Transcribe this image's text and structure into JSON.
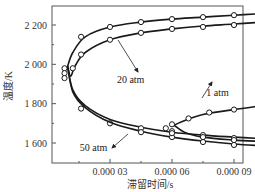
{
  "chart_data": {
    "type": "line",
    "title": "",
    "xlabel": "滞留时间/s",
    "ylabel": "温度/K",
    "xlim": [
      0.0,
      0.000105
    ],
    "ylim": [
      1500,
      2300
    ],
    "x_ticks": [
      {
        "value": 3e-05,
        "label": "0.000 03"
      },
      {
        "value": 6e-05,
        "label": "0.000 06"
      },
      {
        "value": 9e-05,
        "label": "0.000 09"
      }
    ],
    "y_ticks": [
      {
        "value": 1600,
        "label": "1 600"
      },
      {
        "value": 1800,
        "label": "1 800"
      },
      {
        "value": 2000,
        "label": "2 000"
      },
      {
        "value": 2200,
        "label": "2 200"
      }
    ],
    "grid": false,
    "series": [
      {
        "name": "20 atm upper branch",
        "points": [
          [
            9.5e-06,
            1990
          ],
          [
            1.2e-05,
            2060
          ],
          [
            1.8e-05,
            2140
          ],
          [
            3e-05,
            2190
          ],
          [
            4.5e-05,
            2215
          ],
          [
            6e-05,
            2230
          ],
          [
            7.5e-05,
            2240
          ],
          [
            9e-05,
            2250
          ],
          [
            0.000104,
            2258
          ]
        ],
        "markers": [
          [
            1.6e-05,
            2140
          ],
          [
            3e-05,
            2190
          ],
          [
            4.5e-05,
            2215
          ],
          [
            6e-05,
            2230
          ],
          [
            7.5e-05,
            2240
          ],
          [
            9e-05,
            2250
          ]
        ]
      },
      {
        "name": "50 atm upper branch",
        "points": [
          [
            9.5e-06,
            1990
          ],
          [
            1.1e-05,
            1940
          ],
          [
            1.3e-05,
            1990
          ],
          [
            1.8e-05,
            2060
          ],
          [
            3e-05,
            2125
          ],
          [
            4.5e-05,
            2160
          ],
          [
            6e-05,
            2180
          ],
          [
            7.5e-05,
            2195
          ],
          [
            9e-05,
            2205
          ],
          [
            0.000104,
            2215
          ]
        ],
        "markers": [
          [
            8e-06,
            1980
          ],
          [
            8e-06,
            1955
          ],
          [
            1.2e-05,
            1980
          ],
          [
            1.6e-05,
            2050
          ],
          [
            3e-05,
            2125
          ],
          [
            4.5e-05,
            2160
          ],
          [
            6e-05,
            2180
          ],
          [
            7.5e-05,
            2190
          ],
          [
            9e-05,
            2200
          ]
        ]
      },
      {
        "name": "20 atm lower branch",
        "points": [
          [
            9.5e-06,
            1990
          ],
          [
            1.2e-05,
            1870
          ],
          [
            1.8e-05,
            1790
          ],
          [
            3e-05,
            1720
          ],
          [
            4.5e-05,
            1680
          ],
          [
            6e-05,
            1655
          ],
          [
            7.5e-05,
            1640
          ],
          [
            9e-05,
            1630
          ],
          [
            0.000104,
            1622
          ]
        ],
        "markers": [
          [
            8e-06,
            1930
          ],
          [
            1.6e-05,
            1775
          ],
          [
            3e-05,
            1700
          ],
          [
            4.5e-05,
            1675
          ],
          [
            6e-05,
            1660
          ],
          [
            7.5e-05,
            1640
          ],
          [
            9e-05,
            1625
          ]
        ]
      },
      {
        "name": "50 atm lower branch",
        "points": [
          [
            9.5e-06,
            1990
          ],
          [
            1.2e-05,
            1860
          ],
          [
            1.8e-05,
            1780
          ],
          [
            3e-05,
            1705
          ],
          [
            4.5e-05,
            1660
          ],
          [
            6e-05,
            1630
          ],
          [
            7.5e-05,
            1610
          ],
          [
            9e-05,
            1595
          ],
          [
            0.000104,
            1585
          ]
        ],
        "markers": [
          [
            4.5e-05,
            1655
          ],
          [
            6e-05,
            1630
          ],
          [
            7.5e-05,
            1605
          ],
          [
            9e-05,
            1590
          ]
        ]
      },
      {
        "name": "1 atm upper branch",
        "points": [
          [
            6.1e-05,
            1690
          ],
          [
            6.5e-05,
            1710
          ],
          [
            7.5e-05,
            1745
          ],
          [
            9e-05,
            1770
          ],
          [
            0.000104,
            1790
          ]
        ],
        "markers": [
          [
            6e-05,
            1695
          ],
          [
            6.8e-05,
            1725
          ],
          [
            7.8e-05,
            1755
          ],
          [
            9e-05,
            1770
          ]
        ]
      },
      {
        "name": "1 atm lower branch",
        "points": [
          [
            6.1e-05,
            1690
          ],
          [
            6.6e-05,
            1655
          ],
          [
            7.5e-05,
            1630
          ],
          [
            9e-05,
            1615
          ],
          [
            0.000104,
            1608
          ]
        ],
        "markers": [
          [
            5.7e-05,
            1675
          ],
          [
            6e-05,
            1650
          ],
          [
            7.5e-05,
            1630
          ],
          [
            9e-05,
            1615
          ]
        ]
      }
    ],
    "annotations": [
      {
        "text": "20 atm",
        "x": 4e-05,
        "y": 1905,
        "arrow_to": [
          2.8e-05,
          2100
        ]
      },
      {
        "text": "1 atm",
        "x": 8.2e-05,
        "y": 1840,
        "arrow_to": [
          7.4e-05,
          1775
        ]
      },
      {
        "text": "50 atm",
        "x": 2.2e-05,
        "y": 1560,
        "arrow_to": [
          3.6e-05,
          1620
        ]
      }
    ]
  },
  "style": {
    "line_color": "#1a1a1a",
    "marker_fill": "#ffffff",
    "marker_stroke": "#1a1a1a",
    "frame_color": "#555555"
  }
}
